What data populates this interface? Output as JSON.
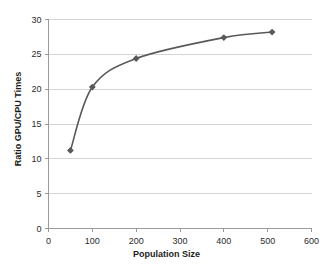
{
  "chart_data": {
    "type": "line",
    "title": "",
    "xlabel": "Population Size",
    "ylabel": "Ratio GPU/CPU Times",
    "xlim": [
      0,
      600
    ],
    "ylim": [
      0,
      30
    ],
    "xticks": [
      0,
      100,
      200,
      300,
      400,
      500,
      600
    ],
    "yticks": [
      0,
      5,
      10,
      15,
      20,
      25,
      30
    ],
    "xtick_labels": [
      "0",
      "100",
      "200",
      "300",
      "400",
      "500",
      "600"
    ],
    "ytick_labels": [
      "0",
      "5",
      "10",
      "15",
      "20",
      "25",
      "30"
    ],
    "grid": "horizontal",
    "legend": "none",
    "smooth": true,
    "marker": "diamond",
    "series": [
      {
        "name": "Ratio GPU/CPU Times",
        "color": "#595959",
        "x": [
          50,
          100,
          200,
          400,
          510
        ],
        "values": [
          11.2,
          20.3,
          24.4,
          27.4,
          28.2
        ]
      }
    ]
  },
  "colors": {
    "line": "#595959",
    "marker": "#595959",
    "grid": "#d4d4d4",
    "axis": "#9a9a9a",
    "text": "#2b2b2b"
  }
}
